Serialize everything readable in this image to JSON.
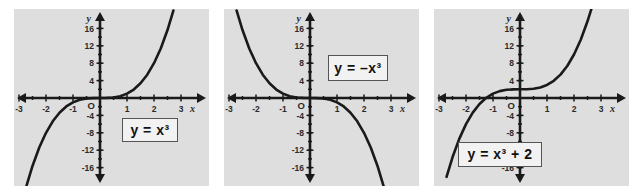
{
  "figure": {
    "background_color": "#ffffff",
    "panel_background_color": "#dedede",
    "ink_color": "#1a1a1a"
  },
  "chart_data": [
    {
      "type": "line",
      "title": "y = x^3",
      "equation_label": "y = x³",
      "equation_label_position": "lower-right",
      "xlabel": "x",
      "ylabel": "y",
      "xlim": [
        -3.3,
        3.3
      ],
      "ylim": [
        -19,
        19
      ],
      "xticks": [
        -3,
        -2,
        -1,
        1,
        2,
        3
      ],
      "xticklabels": [
        "-3",
        "-2",
        "-1",
        "1",
        "2",
        "3"
      ],
      "yticks": [
        -16,
        -12,
        -8,
        -4,
        4,
        8,
        12,
        16
      ],
      "yticklabels": [
        "-16",
        "-12",
        "-8",
        "-4",
        "4",
        "8",
        "12",
        "16"
      ],
      "origin_label": "O",
      "grid": false,
      "legend": false,
      "coefficient": 1,
      "offset": 0,
      "x": [
        -2.72,
        -2.5,
        -2.25,
        -2.0,
        -1.75,
        -1.5,
        -1.25,
        -1.0,
        -0.75,
        -0.5,
        -0.25,
        0,
        0.25,
        0.5,
        0.75,
        1.0,
        1.25,
        1.5,
        1.75,
        2.0,
        2.25,
        2.5,
        2.72
      ],
      "y": [
        -20.12,
        -15.63,
        -11.39,
        -8.0,
        -5.36,
        -3.38,
        -1.95,
        -1.0,
        -0.42,
        -0.13,
        -0.02,
        0,
        0.02,
        0.13,
        0.42,
        1.0,
        1.95,
        3.38,
        5.36,
        8.0,
        11.39,
        15.63,
        20.12
      ]
    },
    {
      "type": "line",
      "title": "y = -x^3",
      "equation_label": "y = –x³",
      "equation_label_position": "upper-right",
      "xlabel": "x",
      "ylabel": "y",
      "xlim": [
        -3.3,
        3.3
      ],
      "ylim": [
        -19,
        19
      ],
      "xticks": [
        -3,
        -2,
        -1,
        1,
        2,
        3
      ],
      "xticklabels": [
        "-3",
        "-2",
        "-1",
        "1",
        "2",
        "3"
      ],
      "yticks": [
        -16,
        -12,
        -8,
        -4,
        4,
        8,
        12,
        16
      ],
      "yticklabels": [
        "-16",
        "-12",
        "-8",
        "-4",
        "4",
        "8",
        "12",
        "16"
      ],
      "origin_label": "O",
      "grid": false,
      "legend": false,
      "coefficient": -1,
      "offset": 0,
      "x": [
        -2.72,
        -2.5,
        -2.25,
        -2.0,
        -1.75,
        -1.5,
        -1.25,
        -1.0,
        -0.75,
        -0.5,
        -0.25,
        0,
        0.25,
        0.5,
        0.75,
        1.0,
        1.25,
        1.5,
        1.75,
        2.0,
        2.25,
        2.5,
        2.72
      ],
      "y": [
        20.12,
        15.63,
        11.39,
        8.0,
        5.36,
        3.38,
        1.95,
        1.0,
        0.42,
        0.13,
        0.02,
        0,
        -0.02,
        -0.13,
        -0.42,
        -1.0,
        -1.95,
        -3.38,
        -5.36,
        -8.0,
        -11.39,
        -15.63,
        -20.12
      ]
    },
    {
      "type": "line",
      "title": "y = x^3 + 2",
      "equation_label": "y = x³ + 2",
      "equation_label_position": "lower-left",
      "xlabel": "x",
      "ylabel": "y",
      "xlim": [
        -3.3,
        3.3
      ],
      "ylim": [
        -19,
        19
      ],
      "xticks": [
        -3,
        -2,
        -1,
        1,
        2,
        3
      ],
      "xticklabels": [
        "-3",
        "-2",
        "-1",
        "1",
        "2",
        "3"
      ],
      "yticks": [
        -16,
        -12,
        -8,
        -4,
        4,
        8,
        12,
        16
      ],
      "yticklabels": [
        "-16",
        "-12",
        "-8",
        "-4",
        "4",
        "8",
        "12",
        "16"
      ],
      "origin_label": "O",
      "grid": false,
      "legend": false,
      "coefficient": 1,
      "offset": 2,
      "x": [
        -2.72,
        -2.5,
        -2.25,
        -2.0,
        -1.75,
        -1.5,
        -1.25,
        -1.0,
        -0.75,
        -0.5,
        -0.25,
        0,
        0.25,
        0.5,
        0.75,
        1.0,
        1.25,
        1.5,
        1.75,
        2.0,
        2.25,
        2.5,
        2.65
      ],
      "y": [
        -18.12,
        -13.63,
        -9.39,
        -6.0,
        -3.36,
        -1.38,
        0.05,
        1.0,
        1.58,
        1.88,
        1.98,
        2.0,
        2.02,
        2.13,
        2.42,
        3.0,
        3.95,
        5.38,
        7.36,
        10.0,
        13.39,
        17.63,
        20.6
      ]
    }
  ]
}
